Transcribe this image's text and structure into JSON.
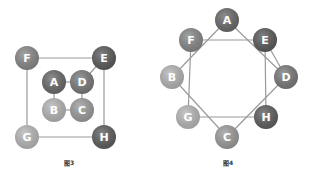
{
  "figures": [
    {
      "caption": "图3",
      "caption_pos": {
        "x": 64,
        "y": 158
      },
      "node_radius": 12,
      "nodes": [
        {
          "id": "F",
          "label": "F",
          "x": 27,
          "y": 58,
          "color": "#888888"
        },
        {
          "id": "E",
          "label": "E",
          "x": 104,
          "y": 58,
          "color": "#5a5a5a"
        },
        {
          "id": "A",
          "label": "A",
          "x": 54,
          "y": 82,
          "color": "#6a6a6a"
        },
        {
          "id": "D",
          "label": "D",
          "x": 82,
          "y": 82,
          "color": "#7a7a7a"
        },
        {
          "id": "B",
          "label": "B",
          "x": 54,
          "y": 110,
          "color": "#b5b5b5"
        },
        {
          "id": "C",
          "label": "C",
          "x": 82,
          "y": 110,
          "color": "#9c9c9c"
        },
        {
          "id": "G",
          "label": "G",
          "x": 27,
          "y": 137,
          "color": "#b8b8b8"
        },
        {
          "id": "H",
          "label": "H",
          "x": 104,
          "y": 137,
          "color": "#5e5e5e"
        }
      ],
      "edges": [
        [
          "F",
          "E"
        ],
        [
          "F",
          "G"
        ],
        [
          "E",
          "H"
        ],
        [
          "G",
          "H"
        ],
        [
          "E",
          "D"
        ],
        [
          "A",
          "D"
        ],
        [
          "A",
          "B"
        ],
        [
          "D",
          "C"
        ],
        [
          "B",
          "C"
        ]
      ]
    },
    {
      "caption": "图4",
      "caption_pos": {
        "x": 223,
        "y": 158
      },
      "node_radius": 12,
      "nodes": [
        {
          "id": "A",
          "label": "A",
          "x": 227,
          "y": 20,
          "color": "#6a6a6a"
        },
        {
          "id": "F",
          "label": "F",
          "x": 191,
          "y": 40,
          "color": "#888888"
        },
        {
          "id": "E",
          "label": "E",
          "x": 265,
          "y": 40,
          "color": "#5a5a5a"
        },
        {
          "id": "B",
          "label": "B",
          "x": 172,
          "y": 77,
          "color": "#b5b5b5"
        },
        {
          "id": "D",
          "label": "D",
          "x": 286,
          "y": 77,
          "color": "#7a7a7a"
        },
        {
          "id": "G",
          "label": "G",
          "x": 188,
          "y": 117,
          "color": "#b8b8b8"
        },
        {
          "id": "H",
          "label": "H",
          "x": 266,
          "y": 117,
          "color": "#5e5e5e"
        },
        {
          "id": "C",
          "label": "C",
          "x": 227,
          "y": 137,
          "color": "#9c9c9c"
        }
      ],
      "edges": [
        [
          "A",
          "B"
        ],
        [
          "A",
          "D"
        ],
        [
          "F",
          "E"
        ],
        [
          "F",
          "G"
        ],
        [
          "E",
          "D"
        ],
        [
          "E",
          "H"
        ],
        [
          "B",
          "C"
        ],
        [
          "D",
          "C"
        ],
        [
          "G",
          "H"
        ]
      ]
    }
  ]
}
